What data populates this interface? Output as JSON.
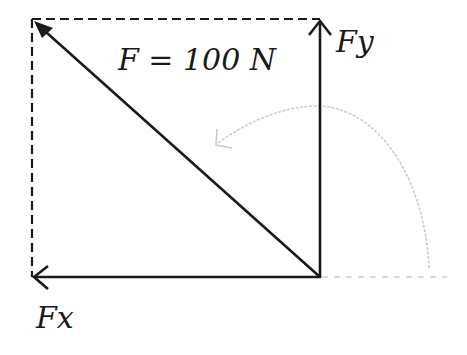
{
  "diagram": {
    "type": "force-vector-decomposition",
    "labels": {
      "resultant": "F = 100 N",
      "y_component": "Fy",
      "x_component": "Fx"
    },
    "colors": {
      "vector": "#1a1a1a",
      "dashed_box": "#1a1a1a",
      "rotation_arc": "#c8c8c8",
      "reference_line": "#c8c8c8",
      "background": "#ffffff"
    },
    "elements": {
      "resultant_vector": "diagonal arrow from origin to top-left corner",
      "y_component_vector": "vertical arrow from origin upward",
      "x_component_vector": "horizontal arrow from origin leftward",
      "dashed_box": "dashed parallelogram completing the rectangle",
      "rotation_arc": "light gray curved arrow indicating angle measured counterclockwise from positive x-axis",
      "reference_line": "light gray dashed line along positive x-axis"
    }
  }
}
